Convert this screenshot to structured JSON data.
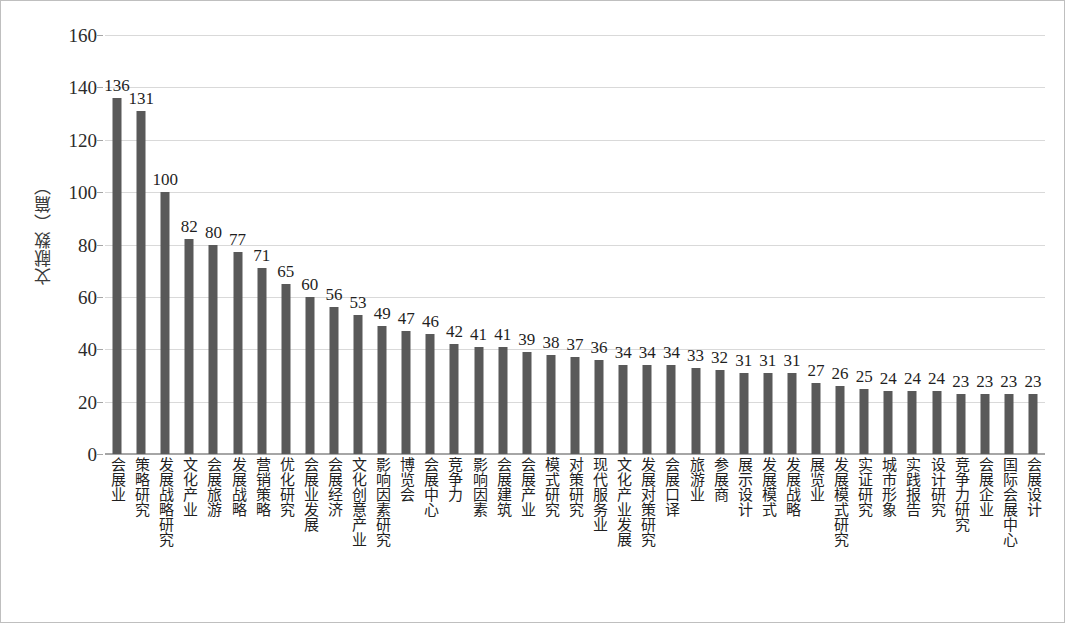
{
  "chart_data": {
    "type": "bar",
    "title": "",
    "xlabel": "",
    "ylabel": "文献数（篇）",
    "ylim": [
      0,
      160
    ],
    "yticks": [
      0,
      20,
      40,
      60,
      80,
      100,
      120,
      140,
      160
    ],
    "grid": true,
    "legend": "none",
    "bar_color": "#595959",
    "categories": [
      "会展业",
      "策略研究",
      "发展战略研究",
      "文化产业",
      "会展旅游",
      "发展战略",
      "营销策略",
      "优化研究",
      "会展业发展",
      "会展经济",
      "文化创意产业",
      "影响因素研究",
      "博览会",
      "会展中心",
      "竞争力",
      "影响因素",
      "会展建筑",
      "会展产业",
      "模式研究",
      "对策研究",
      "现代服务业",
      "文化产业发展",
      "发展对策研究",
      "会展口译",
      "旅游业",
      "参展商",
      "展示设计",
      "发展模式",
      "发展战略",
      "展览业",
      "发展模式研究",
      "实证研究",
      "城市形象",
      "实践报告",
      "设计研究",
      "竞争力研究",
      "会展企业",
      "国际会展中心",
      "会展设计"
    ],
    "values": [
      136,
      131,
      100,
      82,
      80,
      77,
      71,
      65,
      60,
      56,
      53,
      49,
      47,
      46,
      42,
      41,
      41,
      39,
      38,
      37,
      36,
      34,
      34,
      34,
      33,
      32,
      31,
      31,
      31,
      27,
      26,
      25,
      24,
      24,
      24,
      23,
      23,
      23,
      23
    ]
  }
}
